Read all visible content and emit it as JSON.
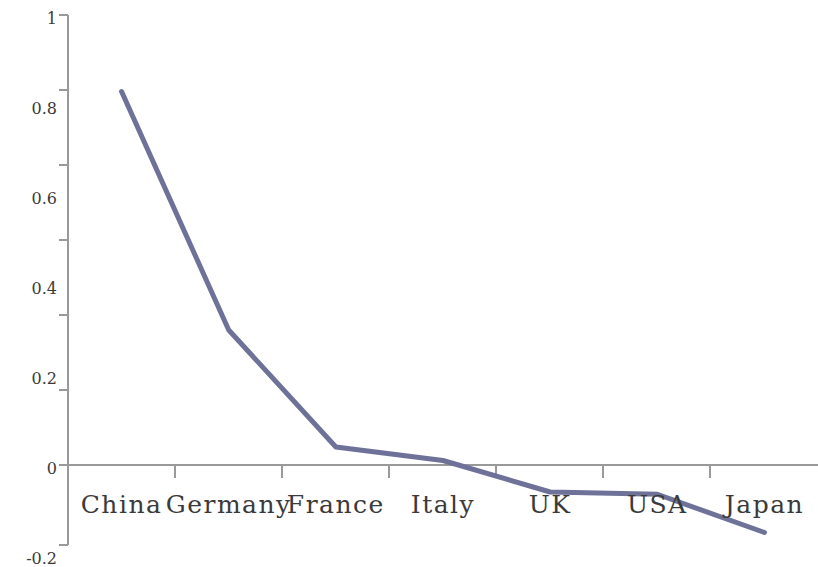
{
  "chart_data": {
    "type": "line",
    "title": "",
    "subtitle": "",
    "xlabel": "",
    "ylabel": "",
    "categories": [
      "China",
      "Germany",
      "France",
      "Italy",
      "UK",
      "USA",
      "Japan"
    ],
    "values": [
      0.83,
      0.3,
      0.04,
      0.01,
      -0.06,
      -0.065,
      -0.15
    ],
    "series": [
      {
        "name": "",
        "values": [
          0.83,
          0.3,
          0.04,
          0.01,
          -0.06,
          -0.065,
          -0.15
        ]
      }
    ],
    "ylim": [
      -0.2,
      1
    ],
    "yticks": [
      1,
      0.8,
      0.6,
      0.4,
      0.2,
      0,
      -0.2
    ],
    "ytick_labels": [
      "1",
      "0.8",
      "0.6",
      "0.4",
      "0.2",
      "0",
      "-0.2"
    ],
    "grid": false,
    "legend": false,
    "legend_position": "none",
    "markers": false,
    "line_color": "#6e7299",
    "axis_color": "#999999",
    "text_color": "#3a3a3a",
    "background_color": "#ffffff",
    "line_width": 5
  }
}
